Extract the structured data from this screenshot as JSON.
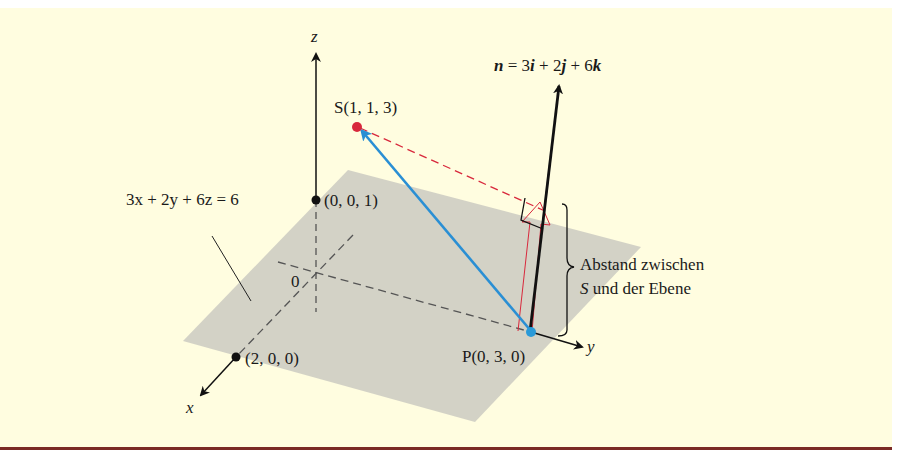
{
  "diagram": {
    "axes": {
      "x_label": "x",
      "y_label": "y",
      "z_label": "z",
      "origin_label": "0"
    },
    "plane": {
      "equation": "3x + 2y + 6z = 6",
      "fill": "#c9c8bd"
    },
    "points": {
      "S": {
        "label": "S(1, 1, 3)",
        "color": "#d8283c"
      },
      "P": {
        "label": "P(0, 3, 0)",
        "color": "#2a9ad8"
      },
      "z_intercept": {
        "label": "(0, 0, 1)"
      },
      "x_intercept": {
        "label": "(2, 0, 0)"
      }
    },
    "normal_vector": {
      "label_n": "n",
      "label_eq": " = 3",
      "i": "i",
      "plus2": " + 2",
      "j": "j",
      "plus6": " + 6",
      "k": "k"
    },
    "distance_note": {
      "line1": "Abstand zwischen",
      "line2_s": "S",
      "line2_rest": " und der Ebene"
    },
    "colors": {
      "background": "#fffde0",
      "vector_PS": "#2a8fd4",
      "projection": "#d8283c",
      "rule": "#7a2a24"
    }
  }
}
